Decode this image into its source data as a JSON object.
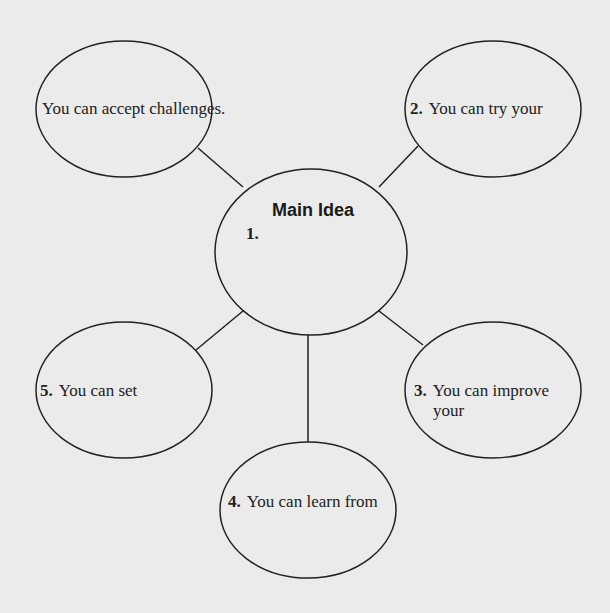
{
  "diagram": {
    "type": "concept-web",
    "colors": {
      "background": "#ebebeb",
      "stroke": "#222222",
      "text": "#222222"
    },
    "center": {
      "title": "Main Idea",
      "number": "1.",
      "text": ""
    },
    "nodes": [
      {
        "position": "top-left",
        "number": "",
        "text": "You can accept challenges."
      },
      {
        "position": "top-right",
        "number": "2.",
        "text": "You can try your"
      },
      {
        "position": "bottom-right",
        "number": "3.",
        "text_line1": "You can improve",
        "text_line2": "your"
      },
      {
        "position": "bottom",
        "number": "4.",
        "text": "You can learn from"
      },
      {
        "position": "bottom-left",
        "number": "5.",
        "text": "You can set"
      }
    ]
  }
}
